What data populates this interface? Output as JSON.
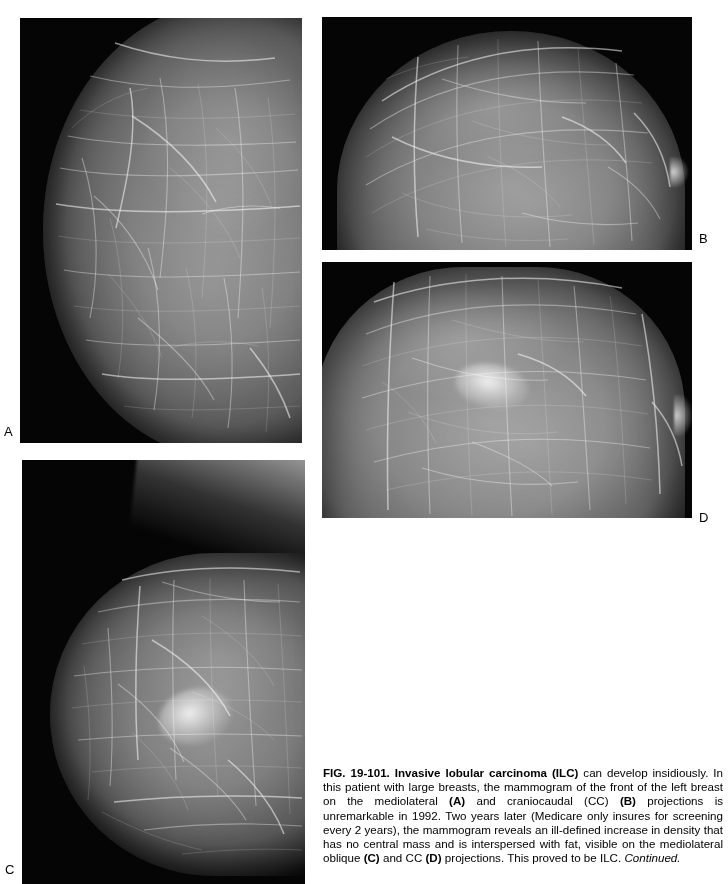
{
  "figure": {
    "id": "FIG. 19-101",
    "caption_lead_bold": "FIG. 19-101. Invasive lobular carcinoma (ILC)",
    "caption_body": " can develop insidiously. In this patient with large breasts, the mammogram of the front of the left breast on the mediolateral ",
    "caption_a_ref": "(A)",
    "caption_body2": " and craniocaudal (CC) ",
    "caption_b_ref": "(B)",
    "caption_body3": " projections is unremarkable in 1992. Two years later (Medicare only insures for screening every 2 years), the mammogram reveals an ill-defined increase in density that has no central mass and is interspersed with fat, visible on the mediolateral oblique ",
    "caption_c_ref": "(C)",
    "caption_body4": " and CC ",
    "caption_d_ref": "(D)",
    "caption_body5": " projections. This proved to be ILC. ",
    "caption_continued": "Continued.",
    "caption_full": "FIG. 19-101. Invasive lobular carcinoma (ILC) can develop insidiously. In this patient with large breasts, the mammogram of the front of the left breast on the mediolateral (A) and craniocaudal (CC) (B) projections is unremarkable in 1992. Two years later (Medicare only insures for screening every 2 years), the mammogram reveals an ill-defined increase in density that has no central mass and is interspersed with fat, visible on the mediolateral oblique (C) and CC (D) projections. This proved to be ILC. Continued."
  },
  "panels": [
    {
      "label": "A",
      "view": "mediolateral",
      "year": "1992",
      "finding": "unremarkable",
      "description": "left breast mediolateral projection, dense fibroglandular tissue"
    },
    {
      "label": "B",
      "view": "craniocaudal (CC)",
      "year": "1992",
      "finding": "unremarkable",
      "description": "left breast craniocaudal projection, dense fibroglandular tissue"
    },
    {
      "label": "C",
      "view": "mediolateral oblique",
      "year": "1994",
      "finding": "ill-defined increase in density, no central mass, interspersed with fat",
      "description": "follow-up mediolateral oblique projection showing ILC"
    },
    {
      "label": "D",
      "view": "craniocaudal (CC)",
      "year": "1994",
      "finding": "ill-defined increase in density, no central mass, interspersed with fat",
      "description": "follow-up craniocaudal projection showing ILC"
    }
  ],
  "colors": {
    "page_background": "#ffffff",
    "film_background": "#000000",
    "text": "#000000",
    "tissue_highlight": "#9a9a9a"
  }
}
